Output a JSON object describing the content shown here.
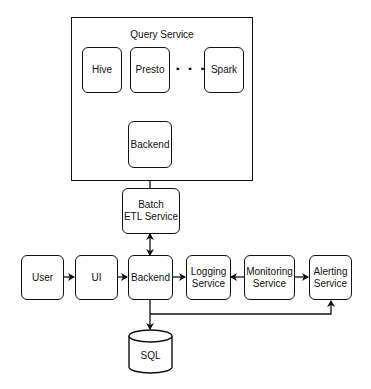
{
  "diagram": {
    "group": {
      "title": "Query Service"
    },
    "nodes": {
      "hive": "Hive",
      "presto": "Presto",
      "spark": "Spark",
      "ellipsis": "▪ ▪ ▪",
      "query_backend": "Backend",
      "batch_etl_line1": "Batch",
      "batch_etl_line2": "ETL Service",
      "user": "User",
      "ui": "UI",
      "backend": "Backend",
      "logging_line1": "Logging",
      "logging_line2": "Service",
      "monitoring_line1": "Monitoring",
      "monitoring_line2": "Service",
      "alerting_line1": "Alerting",
      "alerting_line2": "Service",
      "sql": "SQL"
    },
    "edges": [
      {
        "from": "query_backend",
        "to": "hive"
      },
      {
        "from": "query_backend",
        "to": "presto"
      },
      {
        "from": "query_backend",
        "to": "spark"
      },
      {
        "from": "batch_etl",
        "to": "query_backend"
      },
      {
        "from": "batch_etl",
        "to": "backend",
        "bidirectional": true
      },
      {
        "from": "user",
        "to": "ui"
      },
      {
        "from": "ui",
        "to": "backend"
      },
      {
        "from": "backend",
        "to": "logging"
      },
      {
        "from": "monitoring",
        "to": "logging"
      },
      {
        "from": "monitoring",
        "to": "alerting"
      },
      {
        "from": "backend",
        "to": "sql"
      },
      {
        "from": "backend",
        "to": "alerting"
      }
    ]
  }
}
